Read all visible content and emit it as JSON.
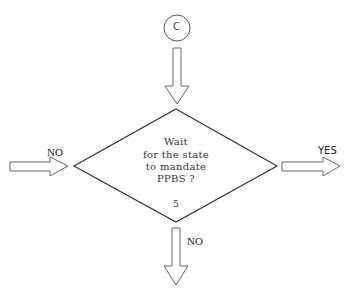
{
  "connector": {
    "label": "C"
  },
  "decision": {
    "lines": [
      "Wait",
      "for the state",
      "to mandate",
      "PPBS ?"
    ],
    "number": "5"
  },
  "arrows": {
    "left": {
      "label": "NO"
    },
    "right": {
      "label": "YES"
    },
    "bottom": {
      "label": "NO"
    }
  },
  "colors": {
    "stroke": "#444444",
    "background": "#ffffff"
  }
}
